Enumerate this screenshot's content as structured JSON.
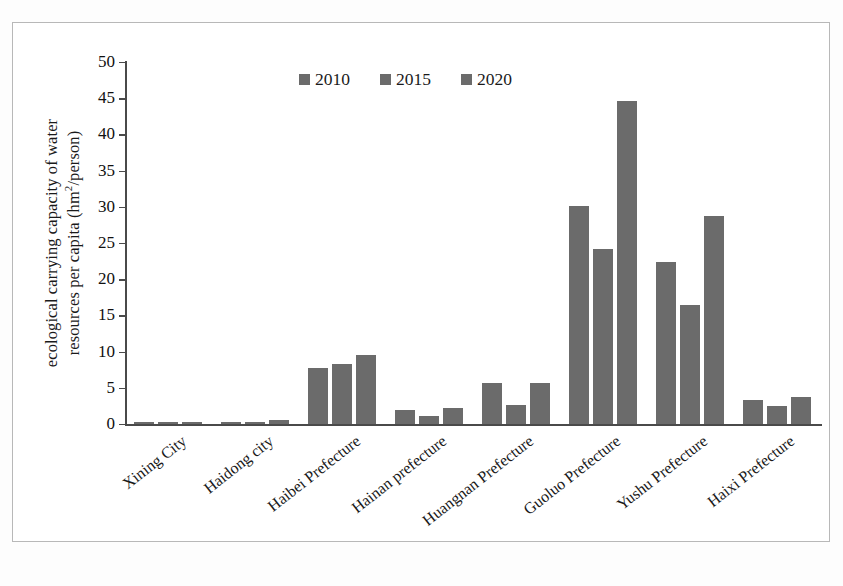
{
  "chart_data": {
    "type": "bar",
    "title": "",
    "subtitle": "",
    "xlabel": "",
    "ylabel": "ecological carrying capacity of water resources per capita (hm2/person)",
    "ylabel_line1": "ecological carrying capacity of water",
    "ylabel_line2_pre": "resources per capita (hm",
    "ylabel_line2_sup": "2",
    "ylabel_line2_post": "/person)",
    "categories": [
      "Xining City",
      "Haidong city",
      "Haibei Prefecture",
      "Hainan prefecture",
      "Huangnan Prefecture",
      "Guoluo Prefecture",
      "Yushu Prefecture",
      "Haixi Prefecture"
    ],
    "series": [
      {
        "name": "2010",
        "color": "#6b6b6b",
        "values": [
          0.2,
          0.2,
          7.7,
          1.9,
          5.7,
          30.1,
          22.4,
          3.3
        ]
      },
      {
        "name": "2015",
        "color": "#6b6b6b",
        "values": [
          0.2,
          0.2,
          8.3,
          1.1,
          2.6,
          24.2,
          16.4,
          2.5
        ]
      },
      {
        "name": "2020",
        "color": "#6b6b6b",
        "values": [
          0.2,
          0.5,
          9.5,
          2.2,
          5.7,
          44.6,
          28.8,
          3.8
        ]
      }
    ],
    "ylim": [
      0,
      50
    ],
    "y_ticks": [
      0,
      5,
      10,
      15,
      20,
      25,
      30,
      35,
      40,
      45,
      50
    ],
    "y_tick_labels": [
      "0",
      "5",
      "10",
      "15",
      "20",
      "25",
      "30",
      "35",
      "40",
      "45",
      "50"
    ],
    "grid": false,
    "legend_position": "top-center",
    "legend_entries": [
      "2010",
      "2015",
      "2020"
    ],
    "bar_color": "#6b6b6b",
    "axis_color": "#4a4a4a",
    "frame_color": "#b8b8b8",
    "background_color": "#ffffff",
    "annotations": []
  }
}
